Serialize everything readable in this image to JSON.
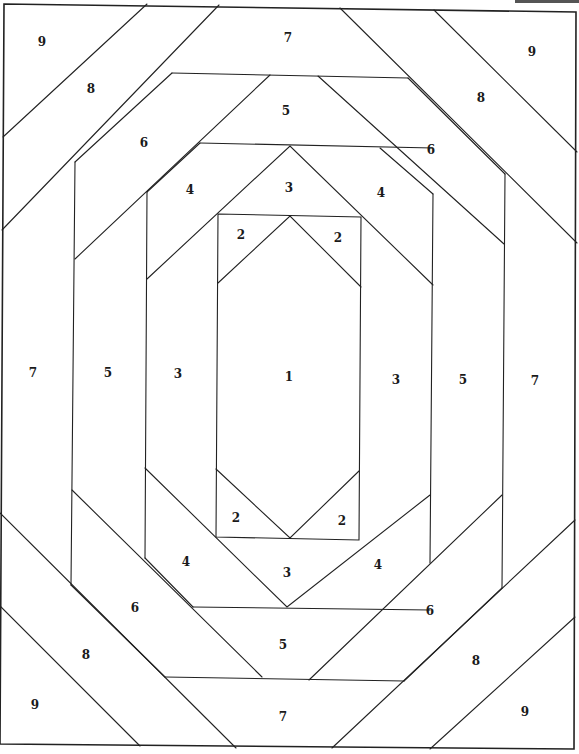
{
  "line_color": "#222222",
  "background_color": "#ffffff",
  "pieces": [
    {
      "id": "piece-1-center",
      "number": "1",
      "region": "center"
    },
    {
      "id": "piece-2-top-left",
      "number": "2",
      "region": "top-left"
    },
    {
      "id": "piece-2-top-right",
      "number": "2",
      "region": "top-right"
    },
    {
      "id": "piece-2-bottom-left",
      "number": "2",
      "region": "bottom-left"
    },
    {
      "id": "piece-2-bottom-right",
      "number": "2",
      "region": "bottom-right"
    },
    {
      "id": "piece-3-top",
      "number": "3",
      "region": "top"
    },
    {
      "id": "piece-3-left",
      "number": "3",
      "region": "left"
    },
    {
      "id": "piece-3-right",
      "number": "3",
      "region": "right"
    },
    {
      "id": "piece-3-bottom",
      "number": "3",
      "region": "bottom"
    },
    {
      "id": "piece-4-top-left",
      "number": "4",
      "region": "top-left"
    },
    {
      "id": "piece-4-top-right",
      "number": "4",
      "region": "top-right"
    },
    {
      "id": "piece-4-bottom-left",
      "number": "4",
      "region": "bottom-left"
    },
    {
      "id": "piece-4-bottom-right",
      "number": "4",
      "region": "bottom-right"
    },
    {
      "id": "piece-5-top",
      "number": "5",
      "region": "top"
    },
    {
      "id": "piece-5-left",
      "number": "5",
      "region": "left"
    },
    {
      "id": "piece-5-right",
      "number": "5",
      "region": "right"
    },
    {
      "id": "piece-5-bottom",
      "number": "5",
      "region": "bottom"
    },
    {
      "id": "piece-6-top-left",
      "number": "6",
      "region": "top-left"
    },
    {
      "id": "piece-6-top-right",
      "number": "6",
      "region": "top-right"
    },
    {
      "id": "piece-6-bottom-left",
      "number": "6",
      "region": "bottom-left"
    },
    {
      "id": "piece-6-bottom-right",
      "number": "6",
      "region": "bottom-right"
    },
    {
      "id": "piece-7-top",
      "number": "7",
      "region": "top"
    },
    {
      "id": "piece-7-left",
      "number": "7",
      "region": "left"
    },
    {
      "id": "piece-7-right",
      "number": "7",
      "region": "right"
    },
    {
      "id": "piece-7-bottom",
      "number": "7",
      "region": "bottom"
    },
    {
      "id": "piece-8-top-left",
      "number": "8",
      "region": "top-left"
    },
    {
      "id": "piece-8-top-right",
      "number": "8",
      "region": "top-right"
    },
    {
      "id": "piece-8-bottom-left",
      "number": "8",
      "region": "bottom-left"
    },
    {
      "id": "piece-8-bottom-right",
      "number": "8",
      "region": "bottom-right"
    },
    {
      "id": "piece-9-top-left",
      "number": "9",
      "region": "top-left"
    },
    {
      "id": "piece-9-top-right",
      "number": "9",
      "region": "top-right"
    },
    {
      "id": "piece-9-bottom-left",
      "number": "9",
      "region": "bottom-left"
    },
    {
      "id": "piece-9-bottom-right",
      "number": "9",
      "region": "bottom-right"
    }
  ]
}
